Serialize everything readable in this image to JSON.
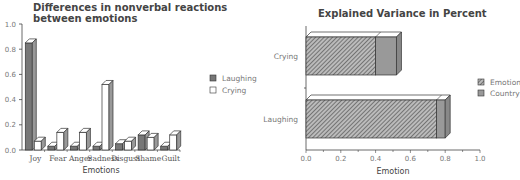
{
  "chart_data": [
    {
      "type": "bar",
      "title": "Differences in nonverbal reactions between emotions",
      "xlabel": "Emotions",
      "ylabel": "",
      "ylim": [
        0,
        1.0
      ],
      "yticks": [
        "0.0",
        "0.2",
        "0.4",
        "0.6",
        "0.8",
        "1.0"
      ],
      "categories": [
        "Joy",
        "Fear",
        "Anger",
        "Sadness",
        "Disgust",
        "Shame",
        "Guilt"
      ],
      "series": [
        {
          "name": "Laughing",
          "color": "#777777",
          "values": [
            0.85,
            0.03,
            0.03,
            0.03,
            0.05,
            0.12,
            0.03
          ]
        },
        {
          "name": "Crying",
          "color": "#ffffff",
          "values": [
            0.07,
            0.14,
            0.14,
            0.52,
            0.07,
            0.1,
            0.12
          ]
        }
      ],
      "legend_position": "right",
      "style": "3d"
    },
    {
      "type": "bar",
      "orientation": "horizontal",
      "stacked": true,
      "title": "Explained Variance in Percent",
      "xlabel": "Emotion",
      "ylabel": "",
      "xlim": [
        0,
        1.0
      ],
      "xticks": [
        "0.0",
        "0.2",
        "0.4",
        "0.6",
        "0.8",
        "1.0"
      ],
      "categories": [
        "Crying",
        "Laughing"
      ],
      "series": [
        {
          "name": "Emotion",
          "pattern": "hatched",
          "values": [
            0.4,
            0.75
          ]
        },
        {
          "name": "Country",
          "color": "#999999",
          "values": [
            0.12,
            0.05
          ]
        }
      ],
      "legend_position": "right",
      "style": "3d"
    }
  ],
  "left": {
    "title_line1": "Differences in nonverbal reactions",
    "title_line2": "between emotions",
    "xlabel": "Emotions",
    "legend": [
      "Laughing",
      "Crying"
    ]
  },
  "right": {
    "title": "Explained Variance in Percent",
    "xlabel": "Emotion",
    "legend": [
      "Emotion",
      "Country"
    ]
  }
}
